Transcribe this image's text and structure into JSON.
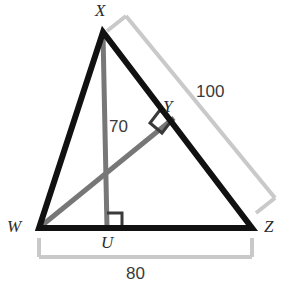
{
  "figure": {
    "kind": "geometry-diagram",
    "colors": {
      "triangle_stroke": "#111111",
      "inner_segment_stroke": "#777777",
      "dimension_stroke": "#c9c9c9",
      "label_text": "#2b2b2b",
      "number_text": "#3a3a3a",
      "background": "#ffffff"
    },
    "vertices": [
      {
        "name": "X",
        "label": "X",
        "x": 103,
        "y": 32,
        "note": "apex, label clipped by top edge"
      },
      {
        "name": "W",
        "label": "W",
        "x": 39,
        "y": 228
      },
      {
        "name": "Z",
        "label": "Z",
        "x": 252,
        "y": 228
      },
      {
        "name": "U",
        "label": "U",
        "x": 107,
        "y": 228,
        "note": "foot of altitude from X on WZ"
      },
      {
        "name": "Y",
        "label": "Y",
        "x": 172,
        "y": 120,
        "note": "foot of perpendicular from W on XZ"
      }
    ],
    "segments": [
      {
        "name": "WX",
        "from": "W",
        "to": "X",
        "style": "thick-black"
      },
      {
        "name": "XZ",
        "from": "X",
        "to": "Z",
        "style": "thick-black"
      },
      {
        "name": "WZ",
        "from": "W",
        "to": "Z",
        "style": "thick-black"
      },
      {
        "name": "XU",
        "from": "X",
        "to": "U",
        "style": "gray",
        "length_label": "70"
      },
      {
        "name": "WY",
        "from": "W",
        "to": "Y",
        "style": "gray"
      }
    ],
    "right_angles": [
      {
        "name": "right-angle-at-U",
        "at": "U",
        "between": [
          "XU",
          "WZ"
        ]
      },
      {
        "name": "right-angle-at-Y",
        "at": "Y",
        "between": [
          "WY",
          "XZ"
        ]
      }
    ],
    "measurements": [
      {
        "name": "altitude-length",
        "value": "70",
        "applies_to": "XU"
      },
      {
        "name": "side-XZ-length",
        "value": "100",
        "applies_to": "XZ"
      },
      {
        "name": "side-WZ-length",
        "value": "80",
        "applies_to": "WZ",
        "note": "label clipped by bottom edge"
      }
    ],
    "dimension_brackets": [
      {
        "name": "bracket-XZ",
        "label": "100",
        "spans": "X to Z",
        "side": "outer-right"
      },
      {
        "name": "bracket-WZ",
        "label": "80",
        "spans": "W to Z",
        "side": "below"
      }
    ]
  }
}
